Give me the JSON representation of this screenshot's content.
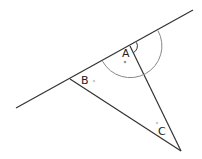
{
  "diagram": {
    "labels": {
      "a": "A",
      "b": "B",
      "c": "C"
    },
    "colors": {
      "line": "#333333",
      "arc": "#888888",
      "dot": "#999999",
      "dot_light": "#cccccc"
    }
  }
}
